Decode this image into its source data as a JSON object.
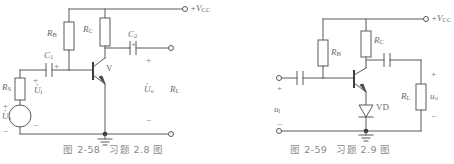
{
  "page": {
    "background_color": "#ffffff",
    "line_color": "#5a5a5a",
    "text_color": "#6a6a6a",
    "caption_color": "#8a8a8a"
  },
  "figures": [
    {
      "id": "fig-2-58",
      "caption_number": "图 2-58",
      "caption_title": "习题 2.8 图",
      "supply_label": "+V",
      "supply_sub": "CC",
      "components": {
        "rb": {
          "label": "R",
          "sub": "B",
          "name": "resistor-rb"
        },
        "rc": {
          "label": "R",
          "sub": "C",
          "name": "resistor-rc"
        },
        "rs": {
          "label": "R",
          "sub": "S",
          "name": "resistor-rs"
        },
        "rl": {
          "label": "R",
          "sub": "L",
          "name": "resistor-rl"
        },
        "c1": {
          "label": "C",
          "sub": "1",
          "name": "capacitor-c1"
        },
        "c2": {
          "label": "C",
          "sub": "2",
          "name": "capacitor-c2"
        },
        "transistor": {
          "label": "V",
          "name": "transistor-v"
        },
        "source": {
          "label": "U",
          "sub": "s",
          "name": "voltage-source-us"
        },
        "ui": {
          "label": "U",
          "sub": "i",
          "name": "input-voltage-ui"
        },
        "uo": {
          "label": "U",
          "sub": "o",
          "name": "output-voltage-uo"
        }
      },
      "polarity": {
        "plus": "+",
        "minus": "−"
      }
    },
    {
      "id": "fig-2-59",
      "caption_number": "图 2-59",
      "caption_title": "习题 2.9 图",
      "supply_label": "+V",
      "supply_sub": "CC",
      "components": {
        "rb": {
          "label": "R",
          "sub": "B",
          "name": "resistor-rb"
        },
        "rc": {
          "label": "R",
          "sub": "C",
          "name": "resistor-rc"
        },
        "rl": {
          "label": "R",
          "sub": "L",
          "name": "resistor-rl"
        },
        "coupling_in": {
          "label": "",
          "name": "capacitor-input"
        },
        "coupling_out": {
          "label": "",
          "name": "capacitor-output"
        },
        "diode": {
          "label": "VD",
          "name": "diode-vd"
        },
        "ui": {
          "label": "u",
          "sub": "i",
          "name": "input-voltage-ui"
        },
        "uo": {
          "label": "u",
          "sub": "o",
          "name": "output-voltage-uo"
        }
      },
      "polarity": {
        "plus": "+",
        "minus": "−"
      }
    }
  ]
}
